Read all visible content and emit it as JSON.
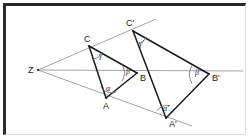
{
  "figure": {
    "background_color": "#ffffff",
    "frame_color": "#2a2a2a",
    "triangle_stroke": "#1a1a1a",
    "ray_stroke": "#8c8c8c",
    "arc_stroke": "#6a6a6a"
  },
  "points": {
    "Z": {
      "label": "Z",
      "x": 38,
      "y": 70,
      "label_x": 28,
      "label_y": 73
    },
    "A": {
      "label": "A",
      "x": 106,
      "y": 98,
      "label_x": 103,
      "label_y": 109
    },
    "B": {
      "label": "B",
      "x": 137,
      "y": 73,
      "label_x": 140,
      "label_y": 81
    },
    "C": {
      "label": "C",
      "x": 89,
      "y": 46,
      "label_x": 84,
      "label_y": 42
    },
    "Aprime": {
      "label": "A'",
      "x": 166,
      "y": 118,
      "label_x": 169,
      "label_y": 127
    },
    "Bprime": {
      "label": "B'",
      "x": 209,
      "y": 74,
      "label_x": 212,
      "label_y": 81
    },
    "Cprime": {
      "label": "C'",
      "x": 133,
      "y": 31,
      "label_x": 126,
      "label_y": 26
    }
  },
  "angles": {
    "alpha": {
      "label": "α",
      "at": "A",
      "label_x": 106,
      "label_y": 91
    },
    "beta": {
      "label": "β",
      "at": "B",
      "label_x": 126,
      "label_y": 74
    },
    "gamma": {
      "label": "γ",
      "at": "C",
      "label_x": 99,
      "label_y": 58
    },
    "alpha_prime": {
      "label": "α'",
      "at": "Aprime",
      "label_x": 163,
      "label_y": 111
    },
    "beta_prime": {
      "label": "β'",
      "at": "Bprime",
      "label_x": 195,
      "label_y": 75
    },
    "gamma_prime": {
      "label": "γ'",
      "at": "Cprime",
      "label_x": 139,
      "label_y": 46
    }
  },
  "rays": [
    {
      "name": "ray-Z-through-C",
      "from": "Z",
      "through": "C",
      "to_x": 156,
      "to_y": 19
    },
    {
      "name": "ray-Z-through-B",
      "from": "Z",
      "through": "B",
      "to_x": 243,
      "to_y": 71
    },
    {
      "name": "ray-Z-through-A",
      "from": "Z",
      "through": "A",
      "to_x": 192,
      "to_y": 126
    }
  ],
  "edges": [
    {
      "name": "edge-AB",
      "from": "A",
      "to": "B"
    },
    {
      "name": "edge-BC",
      "from": "B",
      "to": "C"
    },
    {
      "name": "edge-CA",
      "from": "C",
      "to": "A"
    },
    {
      "name": "edge-ApBp",
      "from": "Aprime",
      "to": "Bprime"
    },
    {
      "name": "edge-BpCp",
      "from": "Bprime",
      "to": "Cprime"
    },
    {
      "name": "edge-CpAp",
      "from": "Cprime",
      "to": "Aprime"
    }
  ]
}
